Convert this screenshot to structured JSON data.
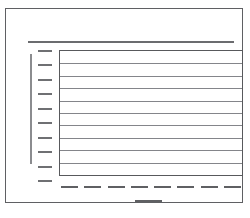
{
  "chart_data": {
    "type": "line",
    "title": "",
    "subtitle": "",
    "xlabel": "",
    "ylabel": "",
    "categories": [],
    "series": [],
    "values": [],
    "grid": true,
    "legend_position": "none",
    "is_placeholder": true,
    "gridlines_horizontal": 9,
    "gridlines_vertical": 0,
    "ytick_count": 10,
    "xtick_count": 8,
    "xtick_labels": [
      "",
      "",
      "",
      "",
      "",
      "",
      "",
      ""
    ],
    "ytick_labels": [
      "",
      "",
      "",
      "",
      "",
      "",
      "",
      "",
      "",
      ""
    ],
    "axis_ranges": {
      "xlim": [
        0,
        1
      ],
      "ylim": [
        0,
        1
      ]
    }
  },
  "page": {
    "frame_label": "",
    "background_color": "#ffffff",
    "border_color": "#5f6063"
  },
  "chart": {
    "title_placeholder": "",
    "ylabel_placeholder": "",
    "xlabel_placeholder": "",
    "plot_area_label": "",
    "grid_color": "#84858a",
    "axis_color": "#58595c",
    "tick_color": "#6f7073"
  }
}
